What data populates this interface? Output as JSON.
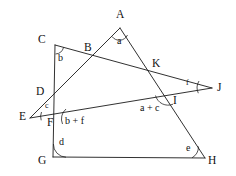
{
  "figure": {
    "background_color": "#ffffff",
    "stroke_color": "#1a1a1a",
    "vertex_labels": [
      {
        "id": "A",
        "text": "A",
        "x": 116,
        "y": 9
      },
      {
        "id": "C",
        "text": "C",
        "x": 38,
        "y": 34
      },
      {
        "id": "B",
        "text": "B",
        "x": 84,
        "y": 42
      },
      {
        "id": "K",
        "text": "K",
        "x": 152,
        "y": 58
      },
      {
        "id": "J",
        "text": "J",
        "x": 217,
        "y": 82
      },
      {
        "id": "D",
        "text": "D",
        "x": 36,
        "y": 86
      },
      {
        "id": "I",
        "text": "I",
        "x": 173,
        "y": 95
      },
      {
        "id": "E",
        "text": "E",
        "x": 19,
        "y": 111
      },
      {
        "id": "F",
        "text": "F",
        "x": 47,
        "y": 117
      },
      {
        "id": "G",
        "text": "G",
        "x": 38,
        "y": 155
      },
      {
        "id": "H",
        "text": "H",
        "x": 208,
        "y": 155
      }
    ],
    "angle_labels": [
      {
        "id": "a",
        "text": "a",
        "x": 117,
        "y": 36
      },
      {
        "id": "b",
        "text": "b",
        "x": 58,
        "y": 53
      },
      {
        "id": "f",
        "text": "f",
        "x": 186,
        "y": 79,
        "size": "small"
      },
      {
        "id": "c",
        "text": "c",
        "x": 45,
        "y": 102,
        "size": "small"
      },
      {
        "id": "a_plus_c",
        "text": "a + c",
        "x": 140,
        "y": 103
      },
      {
        "id": "b_plus_f",
        "text": "b + f",
        "x": 65,
        "y": 116
      },
      {
        "id": "d",
        "text": "d",
        "x": 59,
        "y": 137
      },
      {
        "id": "e",
        "text": "e",
        "x": 186,
        "y": 143
      }
    ],
    "segments": [
      {
        "id": "line-C-J",
        "x1": 55,
        "y1": 45,
        "x2": 212,
        "y2": 88
      },
      {
        "id": "line-A-E",
        "x1": 120,
        "y1": 28,
        "x2": 30,
        "y2": 118
      },
      {
        "id": "line-A-H",
        "x1": 120,
        "y1": 28,
        "x2": 205,
        "y2": 158
      },
      {
        "id": "line-E-J",
        "x1": 30,
        "y1": 118,
        "x2": 212,
        "y2": 88
      },
      {
        "id": "line-C-G",
        "x1": 55,
        "y1": 45,
        "x2": 53,
        "y2": 157
      },
      {
        "id": "line-G-H",
        "x1": 53,
        "y1": 157,
        "x2": 205,
        "y2": 158
      }
    ],
    "angle_arcs": [
      {
        "id": "arc-A",
        "d": "M 112.0 36.5 A 9 9 0 0 0 127.5 35.0"
      },
      {
        "id": "arc-C",
        "d": "M 55.5 54.0 A 9 9 0 0 0 63.6 47.3"
      },
      {
        "id": "arc-J",
        "d": "M 199.0 81.0 A 13 13 0 0 0 198.3 93.2"
      },
      {
        "id": "arc-E",
        "d": "M 41.5 112.0 A 12 12 0 0 0 41.2 120.3"
      },
      {
        "id": "arc-I",
        "d": "M 155.5 95.5 A 13 13 0 0 0 173.0 104.2"
      },
      {
        "id": "arc-F",
        "d": "M 66.0 109.0 A 13 13 0 0 0 62.5 124.0"
      },
      {
        "id": "arc-G",
        "d": "M 53.4 144.0 A 13 13 0 0 0 66.0 157.2"
      },
      {
        "id": "arc-H",
        "d": "M 192.0 157.8 A 13 13 0 0 0 198.5 146.5"
      }
    ]
  }
}
